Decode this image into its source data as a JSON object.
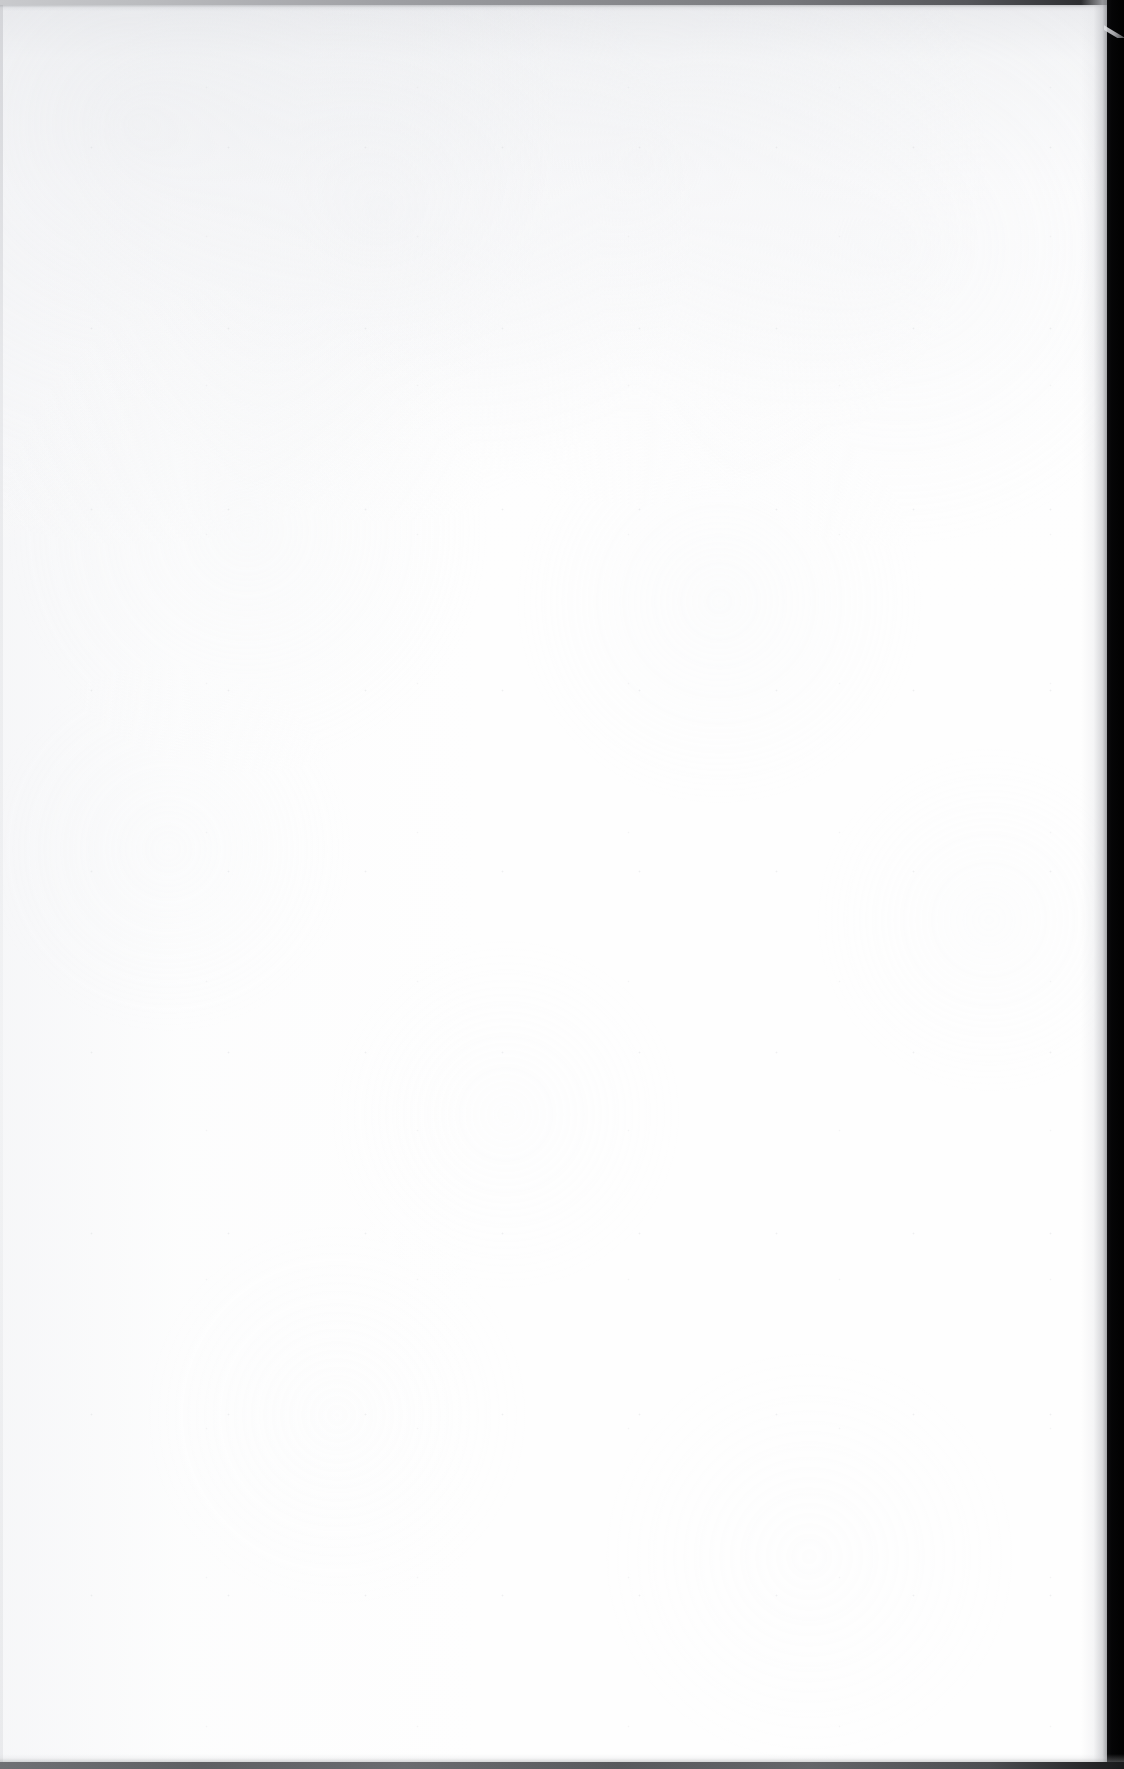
{
  "document": {
    "kind": "scanned-page",
    "page_type": "blank",
    "orientation": "portrait",
    "width_px": 1124,
    "height_px": 1769,
    "visible_text": "",
    "has_text": false,
    "has_figures": false,
    "has_tables": false,
    "content_note": ""
  },
  "paper": {
    "base_color": "#fefefe",
    "highlight_color": "#ffffff",
    "tint_color": "#e8e9ec",
    "grain_color": "#e2e4e8",
    "speckle_color": "#c8cace"
  },
  "scan_artifacts": {
    "top_border": {
      "label": "top-scanner-edge",
      "height_px": 5,
      "color_left": "#c9cacd",
      "color_right": "#141416"
    },
    "right_border": {
      "label": "right-scanner-background",
      "width_px": 17,
      "color": "#010101",
      "paper_edge_x": 1107
    },
    "bottom_border": {
      "label": "bottom-scanner-edge",
      "height_px": 7,
      "color_left": "#6f7074",
      "color_right": "#1a1a1c"
    },
    "left_border": {
      "label": "left-trim-hairline",
      "width_px": 3,
      "color": "#d0d1d5"
    },
    "corner_sliver": {
      "label": "top-right-page-corner-curl",
      "top_px": 12,
      "width_px": 20,
      "height_px": 26,
      "color": "#eceded"
    },
    "right_edge_shadow": {
      "label": "right-edge-falloff",
      "width_px": 26,
      "color": "#96979b"
    }
  }
}
